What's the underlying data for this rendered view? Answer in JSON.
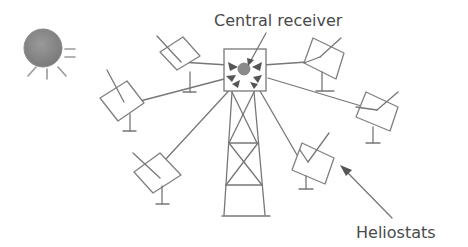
{
  "diagram": {
    "labels": {
      "central_receiver": "Central receiver",
      "heliostats": "Heliostats"
    },
    "elements": {
      "sun": "sun-icon",
      "tower": "lattice-tower",
      "receiver": "central-receiver-box",
      "heliostat_count": 7
    },
    "colors": {
      "line": "#777777",
      "sun_fill": "#8c8c8c",
      "receiver_fill": "#8a8a8a",
      "text": "#4a4a4a",
      "background": "#ffffff"
    }
  }
}
